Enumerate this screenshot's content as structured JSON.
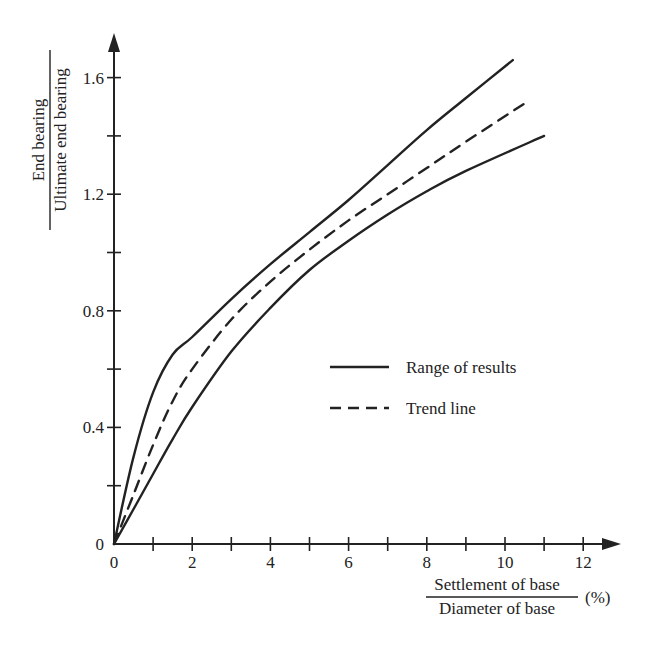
{
  "chart_data": {
    "type": "line",
    "title": "",
    "xlabel": "Settlement of base / Diameter of base (%)",
    "xlabel_numerator": "Settlement of base",
    "xlabel_denominator": "Diameter of base",
    "xlabel_unit": "(%)",
    "ylabel": "End bearing / Ultimate end bearing",
    "ylabel_numerator": "End bearing",
    "ylabel_denominator": "Ultimate end bearing",
    "xlim": [
      0,
      13
    ],
    "ylim": [
      0,
      1.75
    ],
    "x_ticks": [
      "0",
      "2",
      "4",
      "6",
      "8",
      "10",
      "12"
    ],
    "y_ticks": [
      "0",
      "0.4",
      "0.8",
      "1.2",
      "1.6"
    ],
    "grid": false,
    "legend_position": "center-right",
    "legend": [
      {
        "label": "Range of results",
        "style": "solid"
      },
      {
        "label": "Trend line",
        "style": "dashed"
      }
    ],
    "series": [
      {
        "name": "Range of results (upper bound)",
        "style": "solid",
        "x": [
          0,
          0.5,
          1.0,
          1.5,
          2,
          3,
          4,
          5,
          6,
          7,
          8,
          9,
          10.2
        ],
        "y": [
          0,
          0.3,
          0.52,
          0.65,
          0.71,
          0.84,
          0.96,
          1.07,
          1.18,
          1.3,
          1.42,
          1.53,
          1.66
        ]
      },
      {
        "name": "Trend line",
        "style": "dashed",
        "x": [
          0,
          0.5,
          1.0,
          1.5,
          2,
          3,
          4,
          5,
          6,
          7,
          8,
          9,
          10.6
        ],
        "y": [
          0,
          0.17,
          0.34,
          0.49,
          0.6,
          0.77,
          0.9,
          1.01,
          1.11,
          1.2,
          1.29,
          1.38,
          1.52
        ]
      },
      {
        "name": "Range of results (lower bound)",
        "style": "solid",
        "x": [
          0,
          0.5,
          1.0,
          1.5,
          2,
          3,
          4,
          5,
          6,
          7,
          8,
          9,
          11.0
        ],
        "y": [
          0,
          0.12,
          0.24,
          0.36,
          0.47,
          0.66,
          0.81,
          0.94,
          1.04,
          1.13,
          1.21,
          1.28,
          1.4
        ]
      }
    ]
  }
}
